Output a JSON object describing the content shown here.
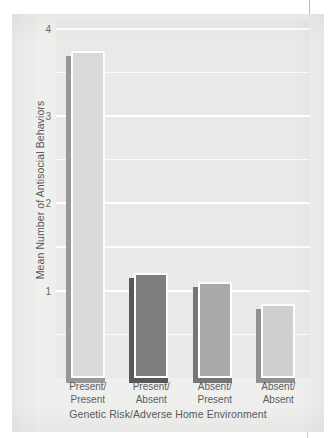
{
  "chart_data": {
    "type": "bar",
    "title": "",
    "subtitle": "",
    "xlabel": "Genetic Risk/Adverse Home Environment",
    "ylabel": "Mean Number of Antisocial Behaviors",
    "categories": [
      "Present/\nPresent",
      "Present/\nAbsent",
      "Absent/\nPresent",
      "Absent/\nAbsent"
    ],
    "category_lines": [
      [
        "Present/",
        "Present"
      ],
      [
        "Present/",
        "Absent"
      ],
      [
        "Absent/",
        "Present"
      ],
      [
        "Absent/",
        "Absent"
      ]
    ],
    "values": [
      3.75,
      1.2,
      1.1,
      0.85
    ],
    "bar_colors": [
      "#d9d9d8",
      "#7e7e7e",
      "#a9a9a8",
      "#cfcfce"
    ],
    "ylim": [
      0,
      4.1
    ],
    "yticks": [
      1,
      2,
      3,
      4
    ],
    "ytick_labels": [
      "1",
      "2",
      "3",
      "4"
    ],
    "gridlines": [
      0.5,
      1,
      1.5,
      2,
      2.5,
      3,
      3.5,
      4
    ],
    "grid": true,
    "legend": "none",
    "orientation": "vertical"
  },
  "figure": {
    "background_color": "#efefee",
    "plot_background_color": "#e9e9e8",
    "gridline_color": "#ffffff",
    "text_color": "#5a5a5a"
  }
}
